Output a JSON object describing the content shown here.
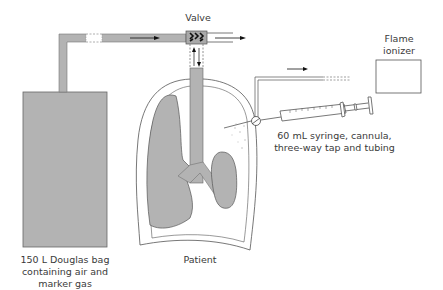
{
  "diagram": {
    "labels": {
      "valve": "Valve",
      "flame_ionizer": [
        "Flame",
        "ionizer"
      ],
      "syringe": [
        "60 mL syringe, cannula,",
        "three-way tap and tubing"
      ],
      "douglas_bag": [
        "150 L Douglas bag",
        "containing air and",
        "marker gas"
      ],
      "patient": "Patient"
    },
    "colors": {
      "fill_gray": "#b3b3b3",
      "outline": "#555555",
      "text": "#3a3a3a",
      "arrow": "#111111"
    }
  }
}
